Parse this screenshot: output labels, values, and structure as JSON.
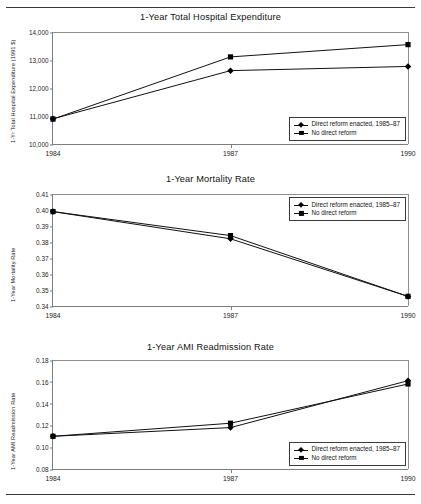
{
  "figure": {
    "top_rule": true,
    "bottom_rule": true,
    "line_color": "#111111",
    "axis_color": "#7d7d7d"
  },
  "legend": {
    "series_1_label": "Direct reform enacted, 1985–87",
    "series_2_label": "No direct reform",
    "marker_1": "diamond",
    "marker_2": "square"
  },
  "charts": [
    {
      "title": "1-Year Total Hospital Expenditure",
      "ylabel": "1-Yr Total Hospital Expenditure (1991 $)",
      "yticks": [
        "14,000",
        "13,000",
        "12,000",
        "11,000",
        "10,000"
      ],
      "xticks": [
        "1984",
        "1987",
        "1990"
      ]
    },
    {
      "title": "1-Year Mortality Rate",
      "ylabel": "1-Year Mortality Rate",
      "yticks": [
        "0.41",
        "0.40",
        "0.39",
        "0.38",
        "0.37",
        "0.36",
        "0.35",
        "0.34"
      ],
      "xticks": [
        "1984",
        "1987",
        "1990"
      ]
    },
    {
      "title": "1-Year AMI Readmission Rate",
      "ylabel": "1-Year AMI Readmission Rate",
      "yticks": [
        "0.18",
        "0.16",
        "0.14",
        "0.12",
        "0.10",
        "0.08"
      ],
      "xticks": [
        "1984",
        "1987",
        "1990"
      ]
    }
  ],
  "chart_data": [
    {
      "type": "line",
      "title": "1-Year Total Hospital Expenditure",
      "xlabel": "",
      "ylabel": "1-Yr Total Hospital Expenditure (1991 $)",
      "x": [
        1984,
        1987,
        1990
      ],
      "categories": [
        "1984",
        "1987",
        "1990"
      ],
      "ylim": [
        10000,
        14000
      ],
      "ytick_values": [
        10000,
        11000,
        12000,
        13000,
        14000
      ],
      "grid": false,
      "legend_position": "bottom-right inside plot",
      "series": [
        {
          "name": "Direct reform enacted, 1985–87",
          "marker": "diamond",
          "values": [
            10900,
            12620,
            12770
          ]
        },
        {
          "name": "No direct reform",
          "marker": "square",
          "values": [
            10890,
            13110,
            13550
          ]
        }
      ]
    },
    {
      "type": "line",
      "title": "1-Year Mortality Rate",
      "xlabel": "",
      "ylabel": "1-Year Mortality Rate",
      "x": [
        1984,
        1987,
        1990
      ],
      "categories": [
        "1984",
        "1987",
        "1990"
      ],
      "ylim": [
        0.34,
        0.41
      ],
      "ytick_values": [
        0.34,
        0.35,
        0.36,
        0.37,
        0.38,
        0.39,
        0.4,
        0.41
      ],
      "grid": false,
      "legend_position": "top-right inside plot",
      "series": [
        {
          "name": "Direct reform enacted, 1985–87",
          "marker": "diamond",
          "values": [
            0.399,
            0.382,
            0.346
          ]
        },
        {
          "name": "No direct reform",
          "marker": "square",
          "values": [
            0.399,
            0.384,
            0.346
          ]
        }
      ]
    },
    {
      "type": "line",
      "title": "1-Year AMI Readmission Rate",
      "xlabel": "",
      "ylabel": "1-Year AMI Readmission Rate",
      "x": [
        1984,
        1987,
        1990
      ],
      "categories": [
        "1984",
        "1987",
        "1990"
      ],
      "ylim": [
        0.08,
        0.18
      ],
      "ytick_values": [
        0.08,
        0.1,
        0.12,
        0.14,
        0.16,
        0.18
      ],
      "grid": false,
      "legend_position": "bottom-right inside plot",
      "series": [
        {
          "name": "Direct reform enacted, 1985–87",
          "marker": "diamond",
          "values": [
            0.11,
            0.118,
            0.161
          ]
        },
        {
          "name": "No direct reform",
          "marker": "square",
          "values": [
            0.11,
            0.122,
            0.158
          ]
        }
      ]
    }
  ]
}
